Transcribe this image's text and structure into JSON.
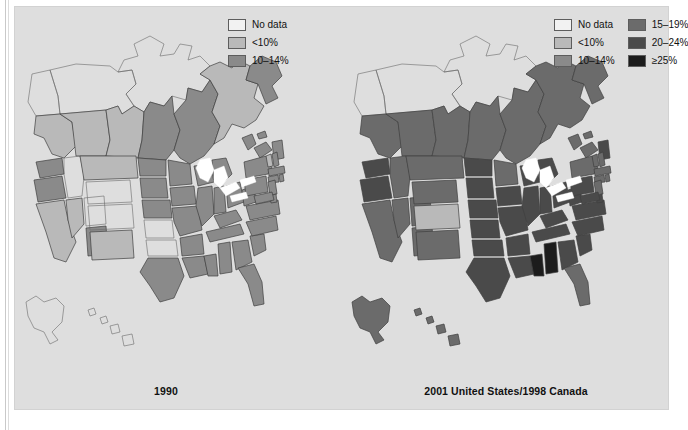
{
  "figure": {
    "type": "choropleth-map-pair",
    "background_color": "#dedede",
    "panels": [
      {
        "id": "left",
        "caption": "1990"
      },
      {
        "id": "right",
        "caption": "2001 United States/1998 Canada"
      }
    ]
  },
  "legend_left": {
    "columns": [
      {
        "items": [
          {
            "label": "No data",
            "color": "#f2f2f2"
          },
          {
            "label": "<10%",
            "color": "#b9b9b9"
          },
          {
            "label": "10–14%",
            "color": "#8a8a8a"
          }
        ]
      }
    ]
  },
  "legend_right": {
    "columns": [
      {
        "items": [
          {
            "label": "No data",
            "color": "#f2f2f2"
          },
          {
            "label": "<10%",
            "color": "#b9b9b9"
          },
          {
            "label": "10–14%",
            "color": "#8a8a8a"
          }
        ]
      },
      {
        "items": [
          {
            "label": "15–19%",
            "color": "#6b6b6b"
          },
          {
            "label": "20–24%",
            "color": "#4a4a4a"
          },
          {
            "label": "≥25%",
            "color": "#1c1c1c"
          }
        ]
      }
    ]
  },
  "chart_data": {
    "type": "heatmap",
    "title": "",
    "subtitle": "",
    "xlabel": "",
    "ylabel": "",
    "legend_position": "top-right",
    "grid": false,
    "units": "percent of population",
    "class_breaks": [
      "No data",
      "<10%",
      "10–14%",
      "15–19%",
      "20–24%",
      "≥25%"
    ],
    "class_colors": [
      "#f2f2f2",
      "#b9b9b9",
      "#8a8a8a",
      "#6b6b6b",
      "#4a4a4a",
      "#1c1c1c"
    ],
    "panels": [
      {
        "name": "1990",
        "regions": {
          "AK": "No data",
          "HI": "No data",
          "WA": "10–14%",
          "OR": "10–14%",
          "CA": "<10%",
          "ID": "No data",
          "NV": "<10%",
          "AZ": "10–14%",
          "UT": "No data",
          "MT": "<10%",
          "WY": "No data",
          "CO": "No data",
          "NM": "<10%",
          "ND": "10–14%",
          "SD": "10–14%",
          "NE": "10–14%",
          "KS": "No data",
          "OK": "No data",
          "TX": "10–14%",
          "MN": "10–14%",
          "IA": "10–14%",
          "MO": "10–14%",
          "AR": "10–14%",
          "LA": "10–14%",
          "WI": "10–14%",
          "IL": "10–14%",
          "MS": "10–14%",
          "MI": "10–14%",
          "IN": "10–14%",
          "KY": "10–14%",
          "TN": "10–14%",
          "AL": "10–14%",
          "OH": "10–14%",
          "WV": "10–14%",
          "GA": "10–14%",
          "FL": "10–14%",
          "SC": "10–14%",
          "NC": "10–14%",
          "VA": "10–14%",
          "PA": "10–14%",
          "NY": "10–14%",
          "ME": "10–14%",
          "VT": "<10%",
          "NH": "10–14%",
          "MA": "10–14%",
          "CT": "10–14%",
          "NJ": "10–14%",
          "MD": "10–14%",
          "DE": "10–14%",
          "RI": "10–14%",
          "YT": "No data",
          "NT": "No data",
          "NU": "No data",
          "BC": "<10%",
          "AB": "<10%",
          "SK": "<10%",
          "MB": "10–14%",
          "ON": "10–14%",
          "QC": "<10%",
          "NL": "10–14%",
          "NB": "10–14%",
          "NS": "10–14%",
          "PE": "10–14%"
        }
      },
      {
        "name": "2001 United States/1998 Canada",
        "regions": {
          "AK": "15–19%",
          "HI": "15–19%",
          "WA": "20–24%",
          "OR": "20–24%",
          "CA": "15–19%",
          "ID": "15–19%",
          "NV": "15–19%",
          "AZ": "15–19%",
          "UT": "15–19%",
          "MT": "15–19%",
          "WY": "15–19%",
          "CO": "<10%",
          "NM": "15–19%",
          "ND": "20–24%",
          "SD": "20–24%",
          "NE": "20–24%",
          "KS": "20–24%",
          "OK": "20–24%",
          "TX": "20–24%",
          "MN": "15–19%",
          "IA": "20–24%",
          "MO": "20–24%",
          "AR": "20–24%",
          "LA": "20–24%",
          "WI": "20–24%",
          "IL": "20–24%",
          "MS": "≥25%",
          "MI": "20–24%",
          "IN": "20–24%",
          "KY": "20–24%",
          "TN": "20–24%",
          "AL": "≥25%",
          "OH": "20–24%",
          "WV": "20–24%",
          "GA": "20–24%",
          "FL": "15–19%",
          "SC": "20–24%",
          "NC": "20–24%",
          "VA": "20–24%",
          "PA": "20–24%",
          "NY": "15–19%",
          "ME": "20–24%",
          "VT": "15–19%",
          "NH": "15–19%",
          "MA": "15–19%",
          "CT": "15–19%",
          "NJ": "15–19%",
          "MD": "20–24%",
          "DE": "20–24%",
          "RI": "15–19%",
          "YT": "No data",
          "NT": "No data",
          "NU": "No data",
          "BC": "15–19%",
          "AB": "15–19%",
          "SK": "15–19%",
          "MB": "15–19%",
          "ON": "15–19%",
          "QC": "15–19%",
          "NL": "15–19%",
          "NB": "15–19%",
          "NS": "15–19%",
          "PE": "15–19%"
        }
      }
    ]
  }
}
